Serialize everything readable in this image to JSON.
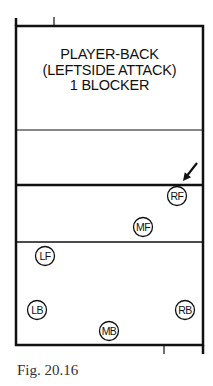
{
  "diagram": {
    "title_lines": [
      "PLAYER-BACK",
      "(LEFTSIDE ATTACK)",
      "1 BLOCKER"
    ],
    "caption": "Fig. 20.16",
    "court": {
      "left": 16,
      "right": 203,
      "top": 26,
      "bottom": 345,
      "lines": [
        {
          "name": "opponent-attack-line",
          "y": 130,
          "width": 1.2
        },
        {
          "name": "net-line",
          "y": 185,
          "width": 2.5
        },
        {
          "name": "attack-line",
          "y": 242,
          "width": 1.5
        }
      ],
      "ticks": [
        {
          "name": "top-tick",
          "x": 54,
          "y1": 17,
          "y2": 26
        },
        {
          "name": "bottom-tick",
          "x": 164,
          "y1": 345,
          "y2": 354
        }
      ]
    },
    "arrow": {
      "from": [
        197,
        163
      ],
      "to": [
        183,
        181
      ]
    },
    "players": [
      {
        "label": "RF",
        "x": 177,
        "y": 196
      },
      {
        "label": "MF",
        "x": 143,
        "y": 227
      },
      {
        "label": "LF",
        "x": 45,
        "y": 256
      },
      {
        "label": "LB",
        "x": 37,
        "y": 310
      },
      {
        "label": "RB",
        "x": 185,
        "y": 310
      },
      {
        "label": "MB",
        "x": 109,
        "y": 331
      }
    ],
    "line_color": "#111111"
  }
}
